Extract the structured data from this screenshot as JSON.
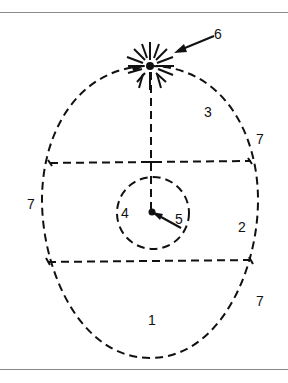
{
  "figure": {
    "labels": {
      "region_1": "1",
      "region_2": "2",
      "region_3": "3",
      "region_4": "4",
      "hand_5": "5",
      "burst_6": "6",
      "boundary_7_upper_right": "7",
      "boundary_7_left": "7",
      "boundary_7_lower_right": "7"
    },
    "colors": {
      "line": "#111111",
      "rule": "#8a8a8a",
      "background": "#ffffff"
    }
  }
}
